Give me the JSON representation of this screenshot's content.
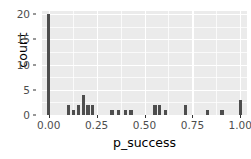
{
  "chart_data": {
    "type": "bar",
    "title": "",
    "subtitle": "",
    "xlabel": "p_success",
    "ylabel": "count",
    "xlim": [
      -0.035,
      1.035
    ],
    "ylim": [
      0,
      20.6
    ],
    "grid": true,
    "legend": null,
    "x_ticks": [
      {
        "value": 0.0,
        "label": "0.00"
      },
      {
        "value": 0.25,
        "label": "0.25"
      },
      {
        "value": 0.5,
        "label": "0.50"
      },
      {
        "value": 0.75,
        "label": "0.75"
      },
      {
        "value": 1.0,
        "label": "1.00"
      }
    ],
    "y_ticks": [
      {
        "value": 0,
        "label": "0"
      },
      {
        "value": 5,
        "label": "5"
      },
      {
        "value": 10,
        "label": "10"
      },
      {
        "value": 15,
        "label": "15"
      },
      {
        "value": 20,
        "label": "20"
      }
    ],
    "x_minor_ticks": [
      0.125,
      0.375,
      0.625,
      0.875
    ],
    "y_minor_ticks": [
      2.5,
      7.5,
      12.5,
      17.5
    ],
    "bar_width": 0.0175,
    "bar_color": "#4d4d4d",
    "panel_background": "#ebebeb",
    "grid_color": "#ffffff",
    "categories": [
      "0.000",
      "0.105",
      "0.130",
      "0.155",
      "0.180",
      "0.205",
      "0.230",
      "0.330",
      "0.365",
      "0.400",
      "0.430",
      "0.555",
      "0.580",
      "0.610",
      "0.715",
      "0.830",
      "0.905",
      "1.000"
    ],
    "values": [
      20,
      2,
      1,
      2,
      4,
      2,
      2,
      1,
      1,
      1,
      1,
      2,
      2,
      1,
      2,
      1,
      1,
      3
    ],
    "points": [
      {
        "x": 0.0,
        "y": 20
      },
      {
        "x": 0.105,
        "y": 2
      },
      {
        "x": 0.13,
        "y": 1
      },
      {
        "x": 0.155,
        "y": 2
      },
      {
        "x": 0.18,
        "y": 4
      },
      {
        "x": 0.205,
        "y": 2
      },
      {
        "x": 0.23,
        "y": 2
      },
      {
        "x": 0.33,
        "y": 1
      },
      {
        "x": 0.365,
        "y": 1
      },
      {
        "x": 0.4,
        "y": 1
      },
      {
        "x": 0.43,
        "y": 1
      },
      {
        "x": 0.555,
        "y": 2
      },
      {
        "x": 0.58,
        "y": 2
      },
      {
        "x": 0.61,
        "y": 1
      },
      {
        "x": 0.715,
        "y": 2
      },
      {
        "x": 0.83,
        "y": 1
      },
      {
        "x": 0.905,
        "y": 1
      },
      {
        "x": 1.0,
        "y": 3
      }
    ]
  }
}
